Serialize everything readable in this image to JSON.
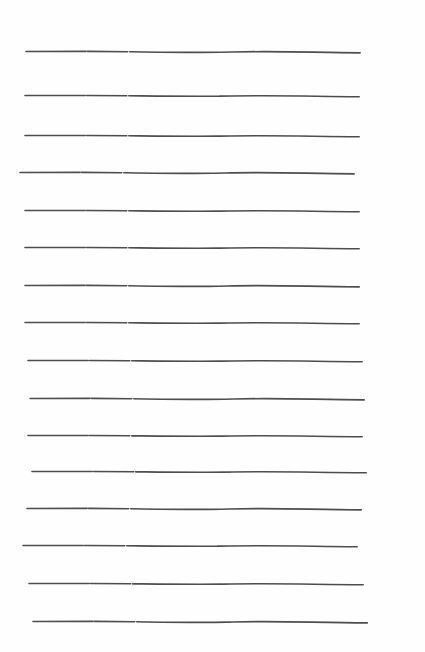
{
  "page": {
    "type": "ruled-blank-page",
    "line_count": 16,
    "line_color": "#3a3a3a",
    "background_color": "#fefefe",
    "lines": [
      {
        "y": 52,
        "x1": 26,
        "x2": 402
      },
      {
        "y": 96,
        "x1": 25,
        "x2": 401
      },
      {
        "y": 136,
        "x1": 25,
        "x2": 397
      },
      {
        "y": 173,
        "x1": 20,
        "x2": 394
      },
      {
        "y": 211,
        "x1": 25,
        "x2": 397
      },
      {
        "y": 248,
        "x1": 25,
        "x2": 398
      },
      {
        "y": 286,
        "x1": 25,
        "x2": 394
      },
      {
        "y": 323,
        "x1": 25,
        "x2": 396
      },
      {
        "y": 361,
        "x1": 28,
        "x2": 399
      },
      {
        "y": 399,
        "x1": 30,
        "x2": 400
      },
      {
        "y": 436,
        "x1": 28,
        "x2": 397
      },
      {
        "y": 472,
        "x1": 32,
        "x2": 397
      },
      {
        "y": 509,
        "x1": 27,
        "x2": 396
      },
      {
        "y": 546,
        "x1": 23,
        "x2": 398
      },
      {
        "y": 584,
        "x1": 29,
        "x2": 397
      },
      {
        "y": 622,
        "x1": 33,
        "x2": 397
      }
    ]
  }
}
